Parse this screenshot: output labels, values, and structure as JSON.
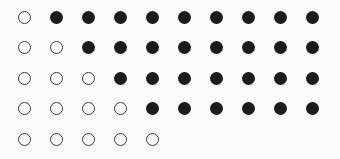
{
  "figure": {
    "title": "",
    "background_color": "#fbfbfa",
    "mark_color": "#1c1c1c",
    "open_stroke_color": "#3a3a3a",
    "rows": 5,
    "columns": 10,
    "marker_diameter_px": 13,
    "column_spacing_px": 32,
    "row_spacing_px": 30.5,
    "first_column_center_x_px": 24,
    "first_row_center_y_px": 17,
    "legend": {
      "open_label": "open circle",
      "filled_label": "filled circle"
    }
  },
  "chart_data": {
    "type": "heatmap",
    "title": "",
    "xlabel": "",
    "ylabel": "",
    "grid": false,
    "legend_position": "none",
    "categories": [
      "1",
      "2",
      "3",
      "4",
      "5",
      "6",
      "7",
      "8",
      "9",
      "10"
    ],
    "row_labels": [
      "1",
      "2",
      "3",
      "4",
      "5"
    ],
    "states": [
      "open",
      "filled"
    ],
    "open_counts": [
      1,
      2,
      3,
      4,
      5
    ],
    "filled_counts": [
      9,
      8,
      7,
      6,
      0
    ],
    "row_lengths": [
      10,
      10,
      10,
      10,
      5
    ],
    "matrix": [
      [
        "open",
        "filled",
        "filled",
        "filled",
        "filled",
        "filled",
        "filled",
        "filled",
        "filled",
        "filled"
      ],
      [
        "open",
        "open",
        "filled",
        "filled",
        "filled",
        "filled",
        "filled",
        "filled",
        "filled",
        "filled"
      ],
      [
        "open",
        "open",
        "open",
        "filled",
        "filled",
        "filled",
        "filled",
        "filled",
        "filled",
        "filled"
      ],
      [
        "open",
        "open",
        "open",
        "open",
        "filled",
        "filled",
        "filled",
        "filled",
        "filled",
        "filled"
      ],
      [
        "open",
        "open",
        "open",
        "open",
        "open",
        null,
        null,
        null,
        null,
        null
      ]
    ]
  }
}
